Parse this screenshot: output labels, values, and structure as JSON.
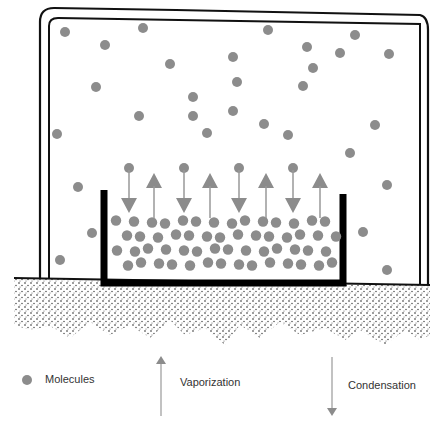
{
  "diagram": {
    "colors": {
      "molecule": "#8c8c8c",
      "arrow": "#8c8c8c",
      "wall": "#111111"
    },
    "gas_molecules": [
      [
        65,
        32
      ],
      [
        105,
        45
      ],
      [
        143,
        28
      ],
      [
        96,
        87
      ],
      [
        170,
        64
      ],
      [
        57,
        134
      ],
      [
        139,
        116
      ],
      [
        193,
        116
      ],
      [
        193,
        97
      ],
      [
        233,
        57
      ],
      [
        237,
        82
      ],
      [
        207,
        133
      ],
      [
        233,
        111
      ],
      [
        264,
        124
      ],
      [
        268,
        30
      ],
      [
        307,
        47
      ],
      [
        313,
        68
      ],
      [
        303,
        86
      ],
      [
        288,
        135
      ],
      [
        355,
        35
      ],
      [
        340,
        53
      ],
      [
        389,
        54
      ],
      [
        375,
        125
      ],
      [
        350,
        153
      ],
      [
        78,
        187
      ],
      [
        92,
        233
      ],
      [
        60,
        260
      ],
      [
        387,
        185
      ],
      [
        363,
        232
      ],
      [
        387,
        270
      ],
      [
        415,
        345
      ]
    ],
    "arrows": [
      {
        "dir": "down",
        "x": 129
      },
      {
        "dir": "up",
        "x": 154
      },
      {
        "dir": "down",
        "x": 184
      },
      {
        "dir": "up",
        "x": 210
      },
      {
        "dir": "down",
        "x": 239
      },
      {
        "dir": "up",
        "x": 266
      },
      {
        "dir": "down",
        "x": 293
      },
      {
        "dir": "up",
        "x": 320
      }
    ],
    "legend": {
      "molecules": "Molecules",
      "vaporization": "Vaporization",
      "condensation": "Condensation"
    }
  }
}
